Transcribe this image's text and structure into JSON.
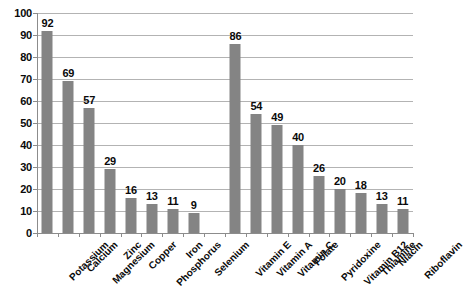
{
  "chart_data": {
    "type": "bar",
    "title": "",
    "subtitle": "",
    "xlabel": "",
    "ylabel": "",
    "ylim": [
      0,
      100
    ],
    "yticks": [
      0,
      10,
      20,
      30,
      40,
      50,
      60,
      70,
      80,
      90,
      100
    ],
    "ytick_labels": [
      "0",
      "10",
      "20",
      "30",
      "40",
      "50",
      "60",
      "70",
      "80",
      "90",
      "100"
    ],
    "grid": true,
    "legend": false,
    "legend_position": "none",
    "bar_color": "#848484",
    "gridline_color": "#b3b3b3",
    "axis_color": "#8c8c8c",
    "data_labels_shown": true,
    "categories": [
      "Potassium",
      "Calcium",
      "Magnesium",
      "Zinc",
      "Copper",
      "Phosphorus",
      "Iron",
      "Selenium",
      "",
      "Vitamin E",
      "Vitamin A",
      "Vitamin C",
      "Folate",
      "Pyridoxine",
      "Vitamin B12",
      "Thiamine",
      "Niacin",
      "Riboflavin"
    ],
    "values": [
      92,
      69,
      57,
      29,
      16,
      13,
      11,
      9,
      null,
      86,
      54,
      49,
      40,
      26,
      20,
      18,
      13,
      11
    ],
    "value_labels": [
      "92",
      "69",
      "57",
      "29",
      "16",
      "13",
      "11",
      "9",
      "",
      "86",
      "54",
      "49",
      "40",
      "26",
      "20",
      "18",
      "13",
      "11"
    ]
  },
  "caption": {
    "text": ""
  }
}
